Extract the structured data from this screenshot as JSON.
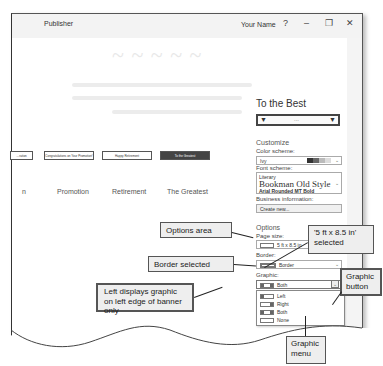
{
  "window": {
    "app_title": "Publisher",
    "user_name": "Your Name",
    "help_label": "?",
    "minimize_label": "–",
    "restore_label": "❐",
    "close_label": "✕"
  },
  "templates": {
    "banners": [
      {
        "text": "…ration"
      },
      {
        "text": "Congratulations on Your Promotion!"
      },
      {
        "text": "Happy Retirement"
      },
      {
        "text": "To the Greatest"
      }
    ],
    "labels": [
      "n",
      "Promotion",
      "Retirement",
      "The Greatest"
    ]
  },
  "panel": {
    "title": "To the Best",
    "preview_dots": "...",
    "customize_label": "Customize",
    "color_scheme_label": "Color scheme:",
    "color_scheme_value": "Ivy",
    "color_swatches": [
      "#333333",
      "#666666",
      "#bbbbbb",
      "#dddddd"
    ],
    "font_scheme_label": "Font scheme:",
    "font_scheme": {
      "name": "Literary",
      "heading_font": "Bookman Old Style",
      "body_font": "Arial Rounded MT Bold"
    },
    "business_info_label": "Business information:",
    "business_info_value": "Create new...",
    "options_label": "Options",
    "page_size_label": "Page size:",
    "page_size_value": "5 ft x 8.5 in",
    "border_label": "Border:",
    "border_value": "Border",
    "graphic_label": "Graphic:",
    "graphic_value": "Both",
    "graphic_menu": [
      {
        "label": "Left"
      },
      {
        "label": "Right"
      },
      {
        "label": "Both"
      },
      {
        "label": "None"
      }
    ]
  },
  "callouts": {
    "options_area": "Options area",
    "page_size_selected": "'5 ft x 8.5 in' selected",
    "border_selected": "Border selected",
    "graphic_button": "Graphic button",
    "left_displays": "Left displays graphic on left edge of banner only",
    "graphic_menu": "Graphic menu"
  }
}
